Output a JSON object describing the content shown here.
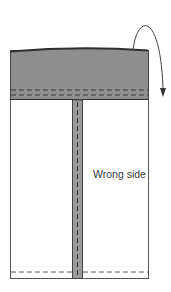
{
  "diagram": {
    "label": "Wrong side",
    "colors": {
      "fabric": "#ffffff",
      "band": "#8e8e8e",
      "band_edge": "#2e2e2e",
      "outline": "#555555",
      "seam": "#3c3c3c",
      "strip": "#9a9a9a",
      "arrow": "#444444"
    }
  }
}
